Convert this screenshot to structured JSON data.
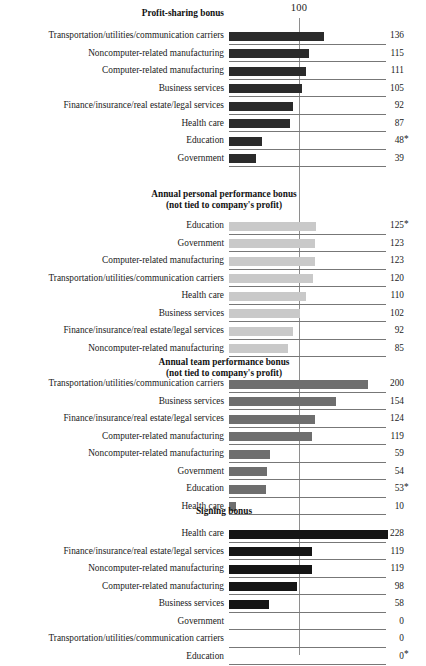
{
  "chart_data": {
    "type": "bar",
    "title": "",
    "xlabel": "",
    "ylabel": "",
    "orientation": "horizontal",
    "grid": false,
    "legend": "none",
    "reference_line": {
      "value": 100,
      "label": "100"
    },
    "xlim": [
      0,
      240
    ],
    "panels": [
      {
        "title": "Profit-sharing bonus",
        "title_align": "right",
        "bar_color": "#2b2b2b",
        "categories": [
          "Transportation/utilities/communication carriers",
          "Noncomputer-related manufacturing",
          "Computer-related manufacturing",
          "Business services",
          "Finance/insurance/real estate/legal services",
          "Health care",
          "Education",
          "Government"
        ],
        "values": [
          136,
          115,
          111,
          105,
          92,
          87,
          48,
          39
        ],
        "value_labels": [
          "136",
          "115",
          "111",
          "105",
          "92",
          "87",
          "48",
          "39"
        ],
        "footnote_marks": [
          "",
          "",
          "",
          "",
          "",
          "",
          "*",
          ""
        ]
      },
      {
        "title": "Annual personal performance bonus",
        "subtitle": "(not tied to company's profit)",
        "title_align": "center",
        "bar_color": "#c9c9c9",
        "categories": [
          "Education",
          "Government",
          "Computer-related manufacturing",
          "Transportation/utilities/communication carriers",
          "Health care",
          "Business services",
          "Finance/insurance/real estate/legal services",
          "Noncomputer-related manufacturing"
        ],
        "values": [
          125,
          123,
          123,
          120,
          110,
          102,
          92,
          85
        ],
        "value_labels": [
          "125",
          "123",
          "123",
          "120",
          "110",
          "102",
          "92",
          "85"
        ],
        "footnote_marks": [
          "*",
          "",
          "",
          "",
          "",
          "",
          "",
          ""
        ]
      },
      {
        "title": "Annual team performance bonus",
        "subtitle": "(not tied to company's profit)",
        "title_align": "center",
        "bar_color": "#6e6e6e",
        "categories": [
          "Transportation/utilities/communication carriers",
          "Business services",
          "Finance/insurance/real estate/legal services",
          "Computer-related manufacturing",
          "Noncomputer-related manufacturing",
          "Government",
          "Education",
          "Health care"
        ],
        "values": [
          200,
          154,
          124,
          119,
          59,
          54,
          53,
          10
        ],
        "value_labels": [
          "200",
          "154",
          "124",
          "119",
          "59",
          "54",
          "53",
          "10"
        ],
        "footnote_marks": [
          "",
          "",
          "",
          "",
          "",
          "",
          "*",
          ""
        ]
      },
      {
        "title": "Signing bonus",
        "title_align": "center",
        "bar_color": "#151515",
        "categories": [
          "Health care",
          "Finance/insurance/real estate/legal services",
          "Noncomputer-related manufacturing",
          "Computer-related manufacturing",
          "Business services",
          "Government",
          "Transportation/utilities/communication carriers",
          "Education"
        ],
        "values": [
          228,
          119,
          119,
          98,
          58,
          0,
          0,
          0
        ],
        "value_labels": [
          "228",
          "119",
          "119",
          "98",
          "58",
          "0",
          "0",
          "0"
        ],
        "footnote_marks": [
          "",
          "",
          "",
          "",
          "",
          "",
          "",
          "*"
        ]
      }
    ]
  }
}
